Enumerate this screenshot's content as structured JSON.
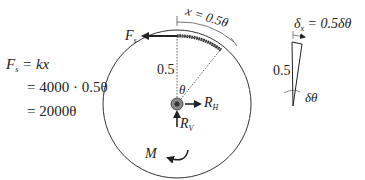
{
  "diagram": {
    "spring_force_label": "F",
    "spring_force_sub": "s",
    "arc_length_label": "x = 0.5θ",
    "radius_label": "0.5",
    "angle_label": "θ",
    "horizontal_reaction_label": "R",
    "horizontal_reaction_sub": "H",
    "vertical_reaction_label": "R",
    "vertical_reaction_sub": "V",
    "moment_label": "M",
    "equations": {
      "line1_lhs": "F",
      "line1_sub": "s",
      "line1_rhs": " = kx",
      "line2": "= 4000 · 0.5θ",
      "line3": "= 2000θ"
    },
    "inset": {
      "displacement_label": "δ",
      "displacement_sub": "x",
      "displacement_rhs": " = 0.5δθ",
      "radius_label": "0.5",
      "angle_label": "δθ"
    },
    "colors": {
      "line": "#333333",
      "spring": "#222222",
      "hub_outer": "#888888",
      "hub_inner": "#333333"
    }
  }
}
